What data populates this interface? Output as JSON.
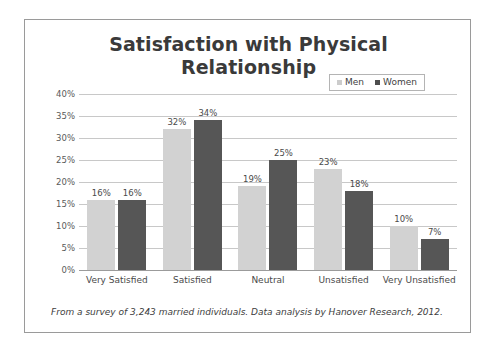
{
  "chart_data": {
    "type": "bar",
    "title": "Satisfaction with Physical Relationship",
    "title_line1": "Satisfaction with Physical",
    "title_line2": "Relationship",
    "categories": [
      "Very Satisfied",
      "Satisfied",
      "Neutral",
      "Unsatisfied",
      "Very Unsatisfied"
    ],
    "series": [
      {
        "name": "Men",
        "color": "#d2d2d2",
        "values": [
          16,
          32,
          19,
          23,
          10
        ],
        "labels": [
          "16%",
          "32%",
          "19%",
          "23%",
          "10%"
        ]
      },
      {
        "name": "Women",
        "color": "#565656",
        "values": [
          16,
          34,
          25,
          18,
          7
        ],
        "labels": [
          "16%",
          "34%",
          "25%",
          "18%",
          "7%"
        ]
      }
    ],
    "xlabel": "",
    "ylabel": "",
    "ylim": [
      0,
      40
    ],
    "ytick_values": [
      40,
      35,
      30,
      25,
      20,
      15,
      10,
      5,
      0
    ],
    "ytick_labels": [
      "40%",
      "35%",
      "30%",
      "25%",
      "20%",
      "15%",
      "10%",
      "5%",
      "0%"
    ],
    "grid": true,
    "legend_position": "top-right"
  },
  "legend": {
    "items": [
      {
        "label": "Men"
      },
      {
        "label": "Women"
      }
    ]
  },
  "footnote": {
    "text": "From a survey of 3,243 married individuals. Data analysis by Hanover Research, 2012."
  }
}
